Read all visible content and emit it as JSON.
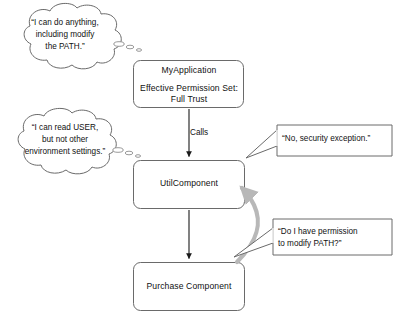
{
  "diagram": {
    "background_color": "#ffffff",
    "stroke_color": "#4a4a4a",
    "arrow_color": "#1a1a1a",
    "gray_arrow_color": "#b8b8b8",
    "text_color": "#111111"
  },
  "nodes": [
    {
      "id": "myapplication",
      "label": "MyApplication",
      "sub_label": "Effective Permission Set:\nFull Trust",
      "shape": "rounded-rectangle"
    },
    {
      "id": "utilcomponent",
      "label": "UtilComponent",
      "shape": "rounded-rectangle"
    },
    {
      "id": "purchasecomponent",
      "label": "Purchase Component",
      "shape": "rounded-rectangle"
    }
  ],
  "edges": [
    {
      "id": "calls",
      "from": "myapplication",
      "to": "utilcomponent",
      "label": "Calls",
      "style": "solid-arrow-down"
    },
    {
      "id": "util-to-purchase",
      "from": "utilcomponent",
      "to": "purchasecomponent",
      "label": "",
      "style": "solid-arrow-down"
    },
    {
      "id": "permission-demand",
      "from": "purchasecomponent",
      "to": "utilcomponent",
      "label": "",
      "style": "curved-gray-arrow-up"
    }
  ],
  "clouds": [
    {
      "id": "fulltrust",
      "text": "“I can do anything,\nincluding modify\nthe PATH.”",
      "attached_to": "myapplication"
    },
    {
      "id": "limited",
      "text": "“I can read USER,\nbut not other\nenvironment settings.”",
      "attached_to": "utilcomponent"
    }
  ],
  "callouts": [
    {
      "id": "denied",
      "text": "“No, security exception.”",
      "points_to": "utilcomponent"
    },
    {
      "id": "ask",
      "text": "“Do I have permission\nto modify PATH?”",
      "points_to": "permission-demand"
    }
  ]
}
